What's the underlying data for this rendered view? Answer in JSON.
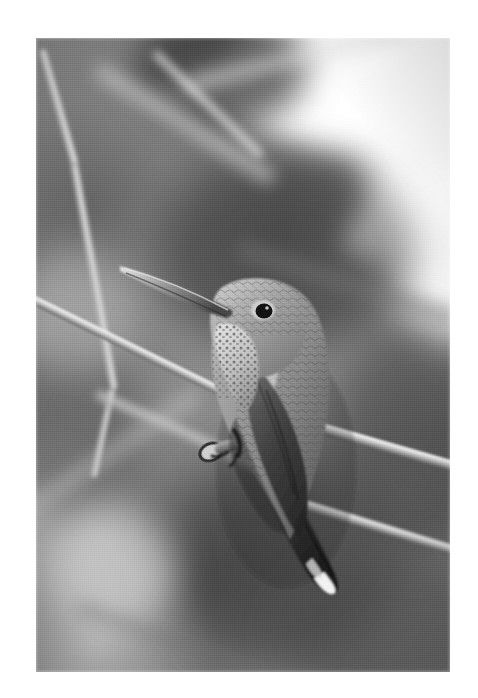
{
  "page": {
    "background_color": "#ffffff",
    "width": 478,
    "height": 698
  },
  "photograph": {
    "title": "Perched hummingbird on a thin branch",
    "medium": "black-and-white photograph",
    "frame": {
      "x": 36,
      "y": 38,
      "width": 414,
      "height": 634
    },
    "palette": {
      "paper_white": "#ffffff",
      "highlight": "#f2f2f2",
      "background_mid_gray": "#8a8a8a",
      "background_dark_gray": "#4f4f4f",
      "branch_light": "#e0e0e0",
      "bird_body": "#8d8d8d",
      "bird_shadow": "#3a3a3a",
      "bird_dark_wing": "#2b2b2b",
      "eye_black": "#141414"
    },
    "subject": {
      "species_label": "hummingbird",
      "pose": "perched in profile facing left",
      "features": [
        {
          "name": "beak",
          "description": "long slender needle-like bill angled up-left"
        },
        {
          "name": "eye",
          "description": "small round black eye with pale eye-ring"
        },
        {
          "name": "throat",
          "description": "pale speckled / spotted gorget"
        },
        {
          "name": "back",
          "description": "mottled scalloped feathering"
        },
        {
          "name": "wing",
          "description": "dark folded wing crossing the body"
        },
        {
          "name": "tail",
          "description": "dark tail angled down-right with white feather tips"
        },
        {
          "name": "feet",
          "description": "tiny feet gripping the branch"
        }
      ]
    },
    "scene_elements": [
      {
        "name": "perch-branch",
        "description": "thin pale branch running diagonally from lower-left to right"
      },
      {
        "name": "upper-branch",
        "description": "light curved branch descending from top-left"
      },
      {
        "name": "secondary-branch",
        "description": "second branch crossing toward lower-right"
      },
      {
        "name": "blown-highlight",
        "description": "bright overexposed area across the upper-right"
      },
      {
        "name": "blurred-foliage",
        "description": "soft out-of-focus dark foliage filling the background"
      },
      {
        "name": "branch-node",
        "description": "small ring-shaped node on the perch near the bird's feet"
      }
    ]
  }
}
